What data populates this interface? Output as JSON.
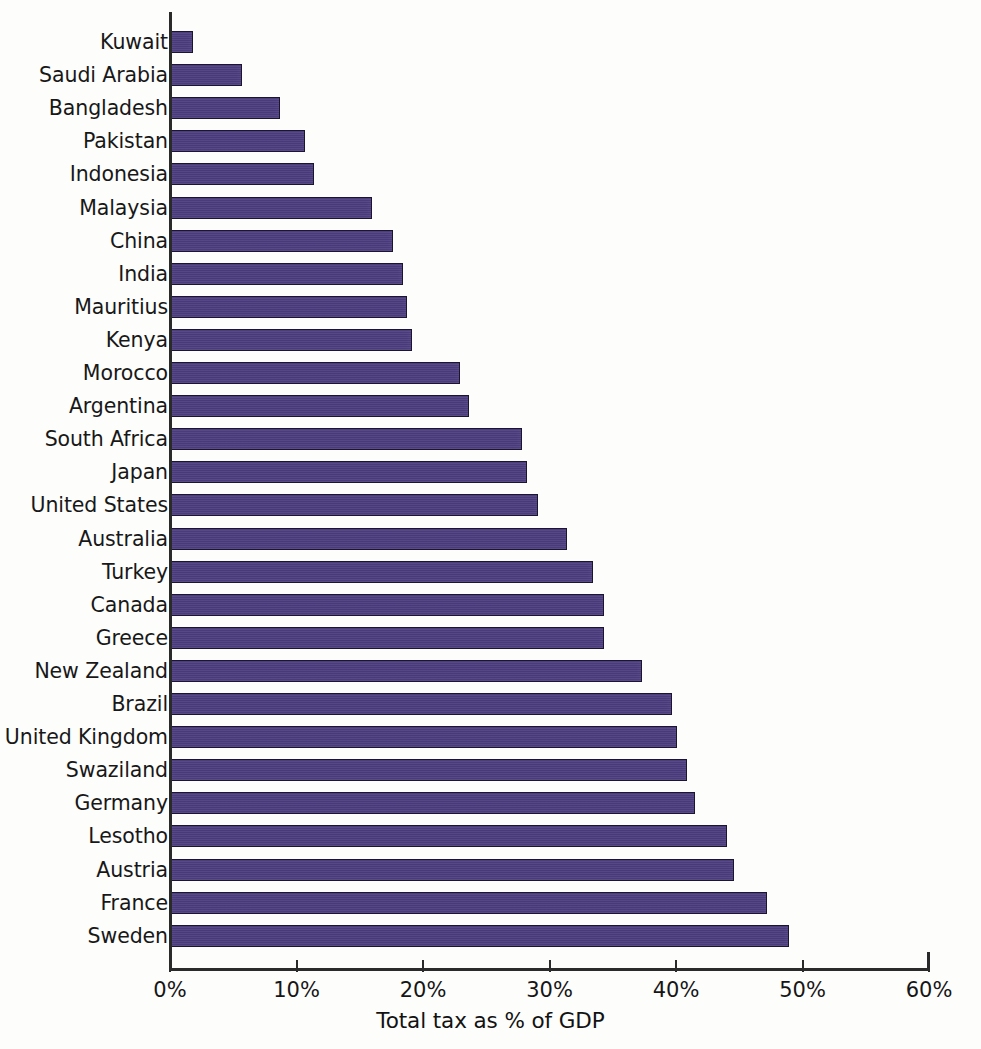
{
  "chart_data": {
    "type": "bar",
    "orientation": "horizontal",
    "title": "",
    "xlabel": "Total tax as % of GDP",
    "ylabel": "",
    "xlim": [
      0,
      60
    ],
    "xticks": [
      0,
      10,
      20,
      30,
      40,
      50,
      60
    ],
    "xtick_labels": [
      "0%",
      "10%",
      "20%",
      "30%",
      "40%",
      "50%",
      "60%"
    ],
    "grid": false,
    "legend": false,
    "bar_color": "#4c3c80",
    "bar_edge_color": "#1c1530",
    "categories": [
      "Kuwait",
      "Saudi Arabia",
      "Bangladesh",
      "Pakistan",
      "Indonesia",
      "Malaysia",
      "China",
      "India",
      "Mauritius",
      "Kenya",
      "Morocco",
      "Argentina",
      "South Africa",
      "Japan",
      "United States",
      "Australia",
      "Turkey",
      "Canada",
      "Greece",
      "New Zealand",
      "Brazil",
      "United Kingdom",
      "Swaziland",
      "Germany",
      "Lesotho",
      "Austria",
      "France",
      "Sweden"
    ],
    "values": [
      1.8,
      5.7,
      8.7,
      10.7,
      11.4,
      16.0,
      17.6,
      18.4,
      18.7,
      19.1,
      22.9,
      23.6,
      27.8,
      28.2,
      29.1,
      31.4,
      33.4,
      34.3,
      34.3,
      37.3,
      39.7,
      40.1,
      40.9,
      41.5,
      44.0,
      44.6,
      47.2,
      48.9
    ]
  }
}
